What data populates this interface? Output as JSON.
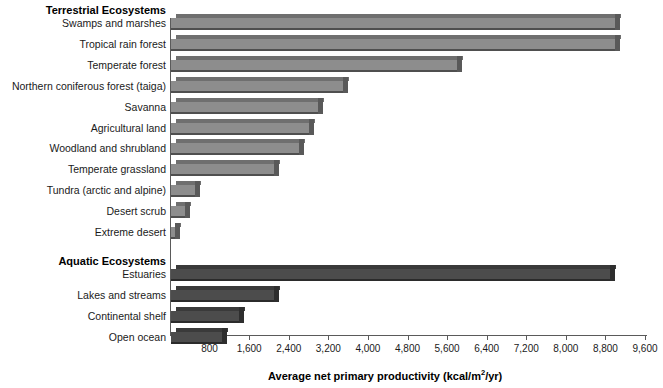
{
  "chart_data": {
    "type": "bar",
    "orientation": "horizontal",
    "title": "",
    "xlabel": "Average net primary productivity (kcal/m2/yr)",
    "xlabel_parts": {
      "main": "Average net primary productivity (kcal/m",
      "sup": "2",
      "tail": "/yr)"
    },
    "ylabel": "",
    "xlim": [
      0,
      9600
    ],
    "xticks": [
      800,
      1600,
      2400,
      3200,
      4000,
      4800,
      5600,
      6400,
      7200,
      8000,
      8800,
      9600
    ],
    "xtick_labels": [
      "800",
      "1,600",
      "2,400",
      "3,200",
      "4,000",
      "4,800",
      "5,600",
      "6,400",
      "7,200",
      "8,000",
      "8,800",
      "9,600"
    ],
    "grid": false,
    "legend": "none",
    "groups": [
      {
        "name": "Terrestrial Ecosystems",
        "color": "#8d8d8d",
        "categories": [
          "Swamps and marshes",
          "Tropical rain forest",
          "Temperate forest",
          "Northern coniferous forest (taiga)",
          "Savanna",
          "Agricultural land",
          "Woodland and shrubland",
          "Temperate grassland",
          "Tundra (arctic and alpine)",
          "Desert scrub",
          "Extreme desert"
        ],
        "values": [
          9000,
          9000,
          5800,
          3500,
          3000,
          2800,
          2600,
          2100,
          500,
          300,
          100
        ]
      },
      {
        "name": "Aquatic Ecosystems",
        "color": "#4c4c4c",
        "categories": [
          "Estuaries",
          "Lakes and streams",
          "Continental shelf",
          "Open ocean"
        ],
        "values": [
          8900,
          2100,
          1400,
          1050
        ]
      }
    ]
  },
  "colors": {
    "terrestrial_face": "#8d8d8d",
    "terrestrial_top": "#6f6f6f",
    "terrestrial_side": "#595959",
    "aquatic_face": "#4c4c4c",
    "aquatic_top": "#3a3a3a",
    "aquatic_side": "#2e2e2e",
    "axis": "#5a5a5a",
    "text": "#1a1a1a",
    "background": "#ffffff"
  }
}
